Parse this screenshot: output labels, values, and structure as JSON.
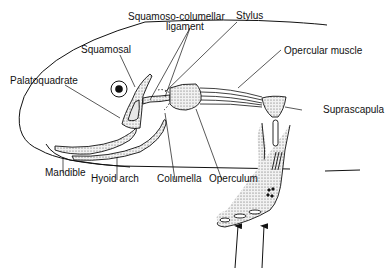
{
  "diagram": {
    "labels": {
      "squamoso_columellar_1": "Squamoso-columellar",
      "squamoso_columellar_2": "ligament",
      "stylus": "Stylus",
      "squamosal": "Squamosal",
      "palatoquadrate": "Palatoquadrate",
      "opercular_muscle": "Opercular muscle",
      "suprascapula": "Suprascapula",
      "mandible": "Mandible",
      "hyoid_arch": "Hyoid arch",
      "columella": "Columella",
      "operculum": "Operculum"
    },
    "colors": {
      "ink": "#111111",
      "stipple": "#d9d9d9",
      "background": "#ffffff"
    },
    "arrows": {
      "count": 2,
      "direction": "up"
    }
  }
}
